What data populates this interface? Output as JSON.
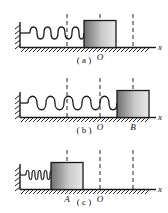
{
  "figure": {
    "background": "#ffffff",
    "ink": "#1a1a1a"
  },
  "panels": [
    {
      "id": "a",
      "caption": "( a )",
      "axis_label": "x",
      "spring_state": "natural",
      "block_label": "",
      "point_labels": [
        {
          "text": "O",
          "x": 100
        }
      ],
      "dashed_lines_x": [
        67,
        100,
        133
      ],
      "block": {
        "x": 84,
        "width": 32,
        "height": 27
      }
    },
    {
      "id": "b",
      "caption": "( b )",
      "axis_label": "x",
      "spring_state": "stretched",
      "block_label": "B",
      "point_labels": [
        {
          "text": "O",
          "x": 100
        },
        {
          "text": "B",
          "x": 133
        }
      ],
      "dashed_lines_x": [
        67,
        100,
        133
      ],
      "block": {
        "x": 117,
        "width": 32,
        "height": 27
      }
    },
    {
      "id": "c",
      "caption": "( c )",
      "axis_label": "x",
      "spring_state": "compressed",
      "block_label": "A",
      "point_labels": [
        {
          "text": "A",
          "x": 67
        },
        {
          "text": "O",
          "x": 100
        }
      ],
      "dashed_lines_x": [
        67,
        100,
        133
      ],
      "block": {
        "x": 51,
        "width": 32,
        "height": 27
      }
    }
  ],
  "colors": {
    "line": "#1a1a1a",
    "dash": "#3a3a3a",
    "block_dark": "#6f6f6f",
    "block_light": "#e6e6e6",
    "spring": "#1a1a1a",
    "ground": "#1a1a1a"
  }
}
